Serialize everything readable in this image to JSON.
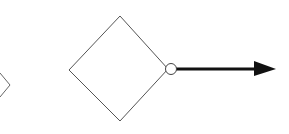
{
  "diagram": {
    "type": "flowchart-fragment",
    "shapes": [
      {
        "id": "partial-diamond-left",
        "kind": "diamond",
        "partial": true,
        "label": ""
      },
      {
        "id": "decision-diamond",
        "kind": "diamond",
        "label": ""
      }
    ],
    "connectors": [
      {
        "from": "decision-diamond",
        "port": "right",
        "port_marker": "open-circle",
        "direction": "right",
        "head": "filled-arrow"
      }
    ],
    "colors": {
      "stroke": "#555555",
      "arrow": "#111111",
      "background": "#ffffff"
    }
  }
}
